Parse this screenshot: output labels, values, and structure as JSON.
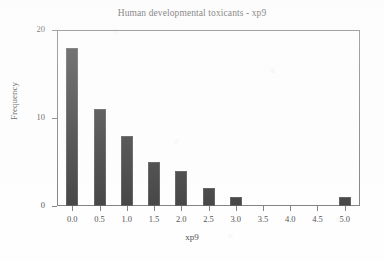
{
  "chart_data": {
    "type": "bar",
    "title": "Human developmental toxicants - xp9",
    "xlabel": "xp9",
    "ylabel": "Frequency",
    "categories": [
      "0.0",
      "0.5",
      "1.0",
      "1.5",
      "2.0",
      "2.5",
      "3.0",
      "3.5",
      "4.0",
      "4.5",
      "5.0"
    ],
    "values": [
      18,
      11,
      8,
      5,
      4,
      2,
      1,
      0,
      0,
      0,
      1
    ],
    "x": [
      0.0,
      0.5,
      1.0,
      1.5,
      2.0,
      2.5,
      3.0,
      3.5,
      4.0,
      4.5,
      5.0
    ],
    "xlim": [
      -0.28,
      5.28
    ],
    "ylim": [
      0,
      20
    ],
    "xticks": [
      "0.0",
      "0.5",
      "1.0",
      "1.5",
      "2.0",
      "2.5",
      "3.0",
      "3.5",
      "4.0",
      "4.5",
      "5.0"
    ],
    "yticks": [
      "0",
      "10",
      "20"
    ],
    "ytick_values": [
      0,
      10,
      20
    ],
    "grid": false,
    "legend": null,
    "bar_color": "#060606",
    "frame_color": "#5a5a5a",
    "background_color": "#fefefe"
  },
  "figure": {
    "title": "Human developmental toxicants - xp9",
    "x_axis_title": "xp9",
    "y_axis_title": "Frequency"
  }
}
